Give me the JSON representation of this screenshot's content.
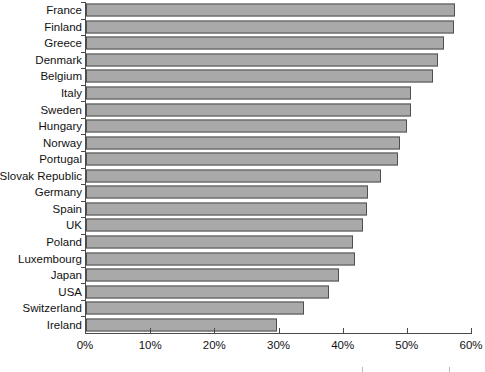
{
  "chart_data": {
    "type": "bar",
    "orientation": "horizontal",
    "title": "",
    "subtitle": "",
    "xlabel": "",
    "ylabel": "",
    "xlim": [
      0,
      60
    ],
    "xtick_step": 10,
    "xtick_labels": [
      "0%",
      "10%",
      "20%",
      "30%",
      "40%",
      "50%",
      "60%"
    ],
    "xtick_values": [
      0,
      10,
      20,
      30,
      40,
      50,
      60
    ],
    "grid": false,
    "legend": false,
    "value_unit": "%",
    "bar_fill_color": "#a9a9a9",
    "bar_border_color": "#4f4f4f",
    "axis_color": "#4a4a4a",
    "categories": [
      "France",
      "Finland",
      "Greece",
      "Denmark",
      "Belgium",
      "Italy",
      "Sweden",
      "Hungary",
      "Norway",
      "Portugal",
      "Slovak Republic",
      "Germany",
      "Spain",
      "UK",
      "Poland",
      "Luxembourg",
      "Japan",
      "USA",
      "Switzerland",
      "Ireland"
    ],
    "values": [
      57.5,
      57.3,
      55.8,
      54.8,
      54.0,
      50.7,
      50.6,
      50.1,
      49.0,
      48.6,
      46.0,
      43.9,
      43.8,
      43.1,
      41.6,
      41.9,
      39.4,
      37.9,
      34.0,
      29.8
    ]
  }
}
